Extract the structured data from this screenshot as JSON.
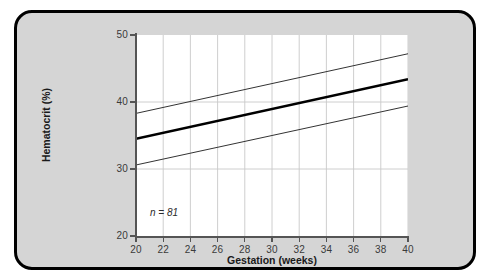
{
  "figure": {
    "background_color": "#d5d5d5",
    "border_color": "#000000",
    "plot_background_color": "#ffffff"
  },
  "chart_data": {
    "type": "line",
    "title": "",
    "subtitle": "",
    "xlabel": "Gestation (weeks)",
    "ylabel": "Hematocrit (%)",
    "xlim": [
      20,
      40
    ],
    "ylim": [
      20,
      50
    ],
    "xticks": [
      20,
      22,
      24,
      26,
      28,
      30,
      32,
      34,
      36,
      38,
      40
    ],
    "xtick_labels": [
      "20",
      "22",
      "24",
      "26",
      "28",
      "30",
      "32",
      "34",
      "36",
      "38",
      "40"
    ],
    "yticks": [
      20,
      30,
      40,
      50
    ],
    "ytick_labels": [
      "20",
      "30",
      "40",
      "50"
    ],
    "grid": {
      "vertical": true,
      "horizontal": true,
      "color": "#c8c8c8",
      "horizontal_lines_at": [
        30,
        40
      ]
    },
    "legend": null,
    "annotations": [
      {
        "name": "sample-size",
        "text": "n = 81",
        "x": 21.2,
        "y": 22.0,
        "italic": true
      }
    ],
    "series": [
      {
        "name": "Upper reference limit",
        "style": "thin",
        "color": "#333333",
        "width": 1.0,
        "x": [
          20,
          40
        ],
        "values": [
          38.3,
          47.2
        ]
      },
      {
        "name": "Mean",
        "style": "thick",
        "color": "#000000",
        "width": 2.4,
        "x": [
          20,
          40
        ],
        "values": [
          34.5,
          43.4
        ]
      },
      {
        "name": "Lower reference limit",
        "style": "thin",
        "color": "#333333",
        "width": 1.0,
        "x": [
          20,
          40
        ],
        "values": [
          30.6,
          39.4
        ]
      }
    ]
  }
}
